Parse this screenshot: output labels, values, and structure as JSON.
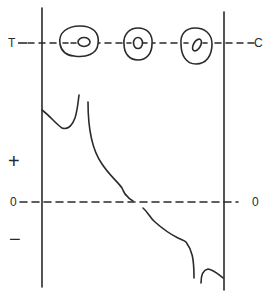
{
  "diagram": {
    "type": "schematic-plot",
    "ink_color": "#2a2a2a",
    "background": "#ffffff",
    "labels": {
      "top_left": "T",
      "top_right": "C",
      "zero_left": "0",
      "zero_right": "0",
      "plus": "+",
      "minus": "−"
    },
    "cells": [
      {
        "name": "cell-1",
        "nucleus": "small round"
      },
      {
        "name": "cell-2",
        "nucleus": "oval"
      },
      {
        "name": "cell-3",
        "nucleus": "tilted oval"
      }
    ],
    "axes": {
      "vertical_lines": 2,
      "zero_line": "dashed",
      "top_line": "dashed axis T to C"
    }
  }
}
